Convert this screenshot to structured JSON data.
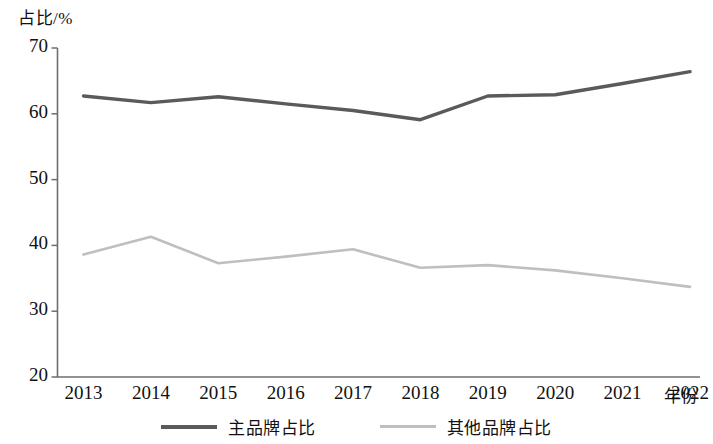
{
  "chart_data": {
    "type": "line",
    "title": "",
    "xlabel": "年份",
    "ylabel": "占比/%",
    "categories": [
      "2013",
      "2014",
      "2015",
      "2016",
      "2017",
      "2018",
      "2019",
      "2020",
      "2021",
      "2022"
    ],
    "x_tick_labels": [
      "2013",
      "2014",
      "2015",
      "2016",
      "2017",
      "2018",
      "2019",
      "2020",
      "2021",
      "2022"
    ],
    "y_tick_labels": [
      "70",
      "60",
      "50",
      "40",
      "30",
      "20"
    ],
    "y_ticks": [
      70,
      60,
      50,
      40,
      30,
      20
    ],
    "ylim": [
      20,
      70
    ],
    "grid": false,
    "legend_position": "bottom-center",
    "series": [
      {
        "name": "主品牌占比",
        "color": "#5a5a5a",
        "values": [
          62.7,
          61.7,
          62.6,
          61.5,
          60.5,
          59.1,
          62.7,
          62.9,
          64.6,
          66.4
        ]
      },
      {
        "name": "其他品牌占比",
        "color": "#bfbfbf",
        "values": [
          38.6,
          41.3,
          37.3,
          38.3,
          39.4,
          36.6,
          37.0,
          36.2,
          35.0,
          33.7
        ]
      }
    ]
  },
  "axes": {
    "y_title": "占比/%",
    "x_title": "年份",
    "axis_color": "#6e6e6e"
  },
  "legend": {
    "items": [
      {
        "label": "主品牌占比",
        "color": "#5a5a5a"
      },
      {
        "label": "其他品牌占比",
        "color": "#bfbfbf"
      }
    ]
  }
}
